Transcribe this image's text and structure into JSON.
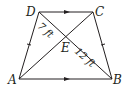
{
  "figure": {
    "type": "isosceles trapezoid with diagonals",
    "vertices": {
      "A": {
        "label": "A",
        "x": 19,
        "y": 79
      },
      "B": {
        "label": "B",
        "x": 112,
        "y": 79
      },
      "C": {
        "label": "C",
        "x": 93,
        "y": 12
      },
      "D": {
        "label": "D",
        "x": 39,
        "y": 12
      }
    },
    "intersection": {
      "label": "E",
      "x": 67,
      "y": 34
    },
    "measurements": {
      "DE": "7 ft",
      "EB": "12 ft"
    },
    "markings": {
      "parallel_sides": [
        "DC",
        "AB"
      ],
      "congruent_sides": [
        "AD",
        "BC"
      ]
    },
    "stroke_color": "#231f20"
  }
}
